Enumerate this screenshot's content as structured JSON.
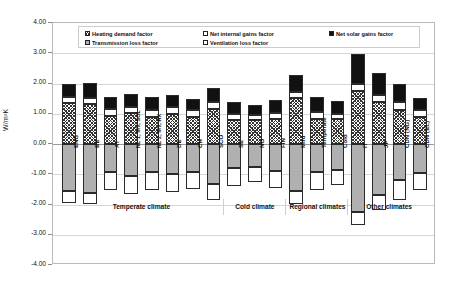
{
  "chart_data": {
    "type": "bar",
    "subtype": "stacked-bar-positive-negative",
    "title": "",
    "xlabel": "",
    "ylabel": "W/m²K",
    "ylim": [
      -4.0,
      4.0
    ],
    "ytick_step": 1.0,
    "ytick_labels": [
      "4.00",
      "3.00",
      "2.00",
      "1.00",
      "0.00",
      "-1.00",
      "-2.00",
      "-3.00",
      "-4.00"
    ],
    "ytick_values": [
      4.0,
      3.0,
      2.0,
      1.0,
      0.0,
      -1.0,
      -2.0,
      -3.0,
      -4.0
    ],
    "grid": true,
    "legend_position": "top-inside",
    "categories": [
      "ENG",
      "BE",
      "AT",
      "NL 1; MV, SOL",
      "NL 2; MV, HX",
      "DE",
      "CH",
      "SCO",
      "SE",
      "NO",
      "FIN",
      "Mild",
      "Temperate",
      "Cold",
      "IT",
      "JP",
      "CDN (NG)",
      "CDN (EL)"
    ],
    "series": [
      {
        "name": "Net solar gains factor",
        "pattern": "black",
        "values": [
          0.45,
          0.5,
          0.4,
          0.42,
          0.4,
          0.4,
          0.37,
          0.46,
          0.38,
          0.35,
          0.4,
          0.55,
          0.48,
          0.42,
          1.0,
          0.72,
          0.6,
          0.4
        ]
      },
      {
        "name": "Net internal gains factor",
        "pattern": "white",
        "values": [
          0.2,
          0.2,
          0.22,
          0.2,
          0.26,
          0.22,
          0.22,
          0.22,
          0.2,
          0.17,
          0.22,
          0.2,
          0.25,
          0.18,
          0.22,
          0.25,
          0.24,
          0.22
        ]
      },
      {
        "name": "Heating demand factor",
        "pattern": "checker",
        "values": [
          1.35,
          1.32,
          0.93,
          1.03,
          0.88,
          1.0,
          0.9,
          1.17,
          0.8,
          0.78,
          0.82,
          1.52,
          0.82,
          0.82,
          1.76,
          1.38,
          1.14,
          0.9
        ]
      },
      {
        "name": "Transmission loss factor",
        "pattern": "gray",
        "values": [
          -1.55,
          -1.62,
          -0.92,
          -1.05,
          -0.92,
          -1.0,
          -0.92,
          -1.32,
          -0.78,
          -0.75,
          -0.9,
          -1.57,
          -0.92,
          -0.86,
          -2.25,
          -1.67,
          -1.2,
          -0.95
        ]
      },
      {
        "name": "Ventilation loss factor",
        "pattern": "white",
        "values": [
          -0.4,
          -0.38,
          -0.6,
          -0.6,
          -0.6,
          -0.6,
          -0.58,
          -0.52,
          -0.6,
          -0.52,
          -0.55,
          -0.42,
          -0.6,
          -0.5,
          -0.42,
          -0.52,
          -0.64,
          -0.58
        ]
      }
    ],
    "groups": [
      {
        "label": "Temperate climate",
        "from": 0,
        "to": 7
      },
      {
        "label": "Cold climate",
        "from": 8,
        "to": 10
      },
      {
        "label": "Regional climates",
        "from": 11,
        "to": 13
      },
      {
        "label": "Other climates",
        "from": 14,
        "to": 17
      }
    ]
  },
  "legend": {
    "items": [
      {
        "label": "Heating demand factor",
        "pattern": "checker"
      },
      {
        "label": "Net internal gains factor",
        "pattern": "white"
      },
      {
        "label": "Net solar gains factor",
        "pattern": "black"
      },
      {
        "label": "Transmission loss factor",
        "pattern": "gray"
      },
      {
        "label": "Ventilation loss factor",
        "pattern": "white"
      }
    ]
  },
  "colors": {
    "black": "#111111",
    "white": "#ffffff",
    "gray": "#b0b0b0",
    "outline": "#2a2a2a",
    "gridline": "#d6d6d6",
    "zeroline": "#9a9a9a",
    "frame": "#b9b9b9"
  }
}
